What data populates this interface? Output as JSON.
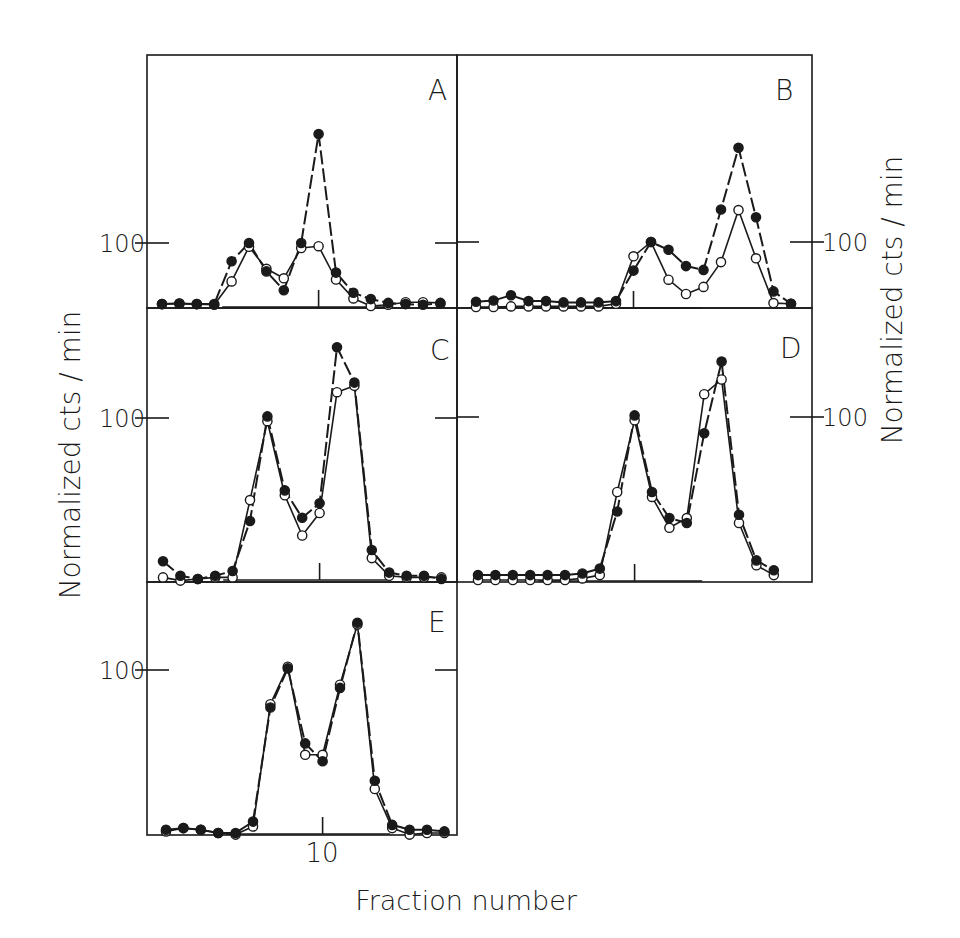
{
  "figure": {
    "xlabel": "Fraction number",
    "ylabel_left": "Normalized  cts / min",
    "ylabel_right": "Normalized  cts / min",
    "x_tick_label": "10",
    "y_tick_label": "100"
  },
  "chart_data": [
    {
      "panel": "A",
      "type": "line",
      "title": "A",
      "xlabel": "Fraction number",
      "ylabel": "Normalized cts/min",
      "x": [
        1,
        2,
        3,
        4,
        5,
        6,
        7,
        8,
        9,
        10,
        11,
        12,
        13,
        14,
        15,
        16,
        17
      ],
      "x_ticks": [
        10
      ],
      "y_ticks": [
        100
      ],
      "ylim": [
        0,
        390
      ],
      "series": [
        {
          "name": "filled circles",
          "marker": "filled",
          "values": [
            3,
            4,
            3,
            3,
            71,
            100,
            55,
            25,
            100,
            273,
            53,
            21,
            11,
            5,
            3,
            2,
            4
          ]
        },
        {
          "name": "open circles",
          "marker": "open",
          "values": [
            3,
            4,
            3,
            2,
            39,
            94,
            59,
            44,
            92,
            95,
            42,
            12,
            0,
            2,
            6,
            6,
            5
          ]
        }
      ]
    },
    {
      "panel": "B",
      "type": "line",
      "title": "B",
      "xlabel": "Fraction number",
      "ylabel": "Normalized cts/min",
      "x": [
        1,
        2,
        3,
        4,
        5,
        6,
        7,
        8,
        9,
        10,
        11,
        12,
        13,
        14,
        15,
        16,
        17,
        18,
        19
      ],
      "x_ticks": [
        10
      ],
      "y_ticks": [
        100
      ],
      "ylim": [
        0,
        390
      ],
      "series": [
        {
          "name": "filled circles",
          "marker": "filled",
          "values": [
            8,
            10,
            18,
            9,
            9,
            7,
            7,
            7,
            9,
            56,
            100,
            88,
            63,
            57,
            150,
            245,
            138,
            24,
            5
          ]
        },
        {
          "name": "open circles",
          "marker": "open",
          "values": [
            0,
            0,
            1,
            1,
            1,
            1,
            1,
            1,
            5,
            78,
            100,
            42,
            20,
            31,
            69,
            149,
            75,
            6,
            5
          ]
        }
      ]
    },
    {
      "panel": "C",
      "type": "line",
      "title": "C",
      "xlabel": "Fraction number",
      "ylabel": "Normalized cts/min",
      "x": [
        1,
        2,
        3,
        4,
        5,
        6,
        7,
        8,
        9,
        10,
        11,
        12,
        13,
        14,
        15,
        16,
        17
      ],
      "x_ticks": [
        10
      ],
      "y_ticks": [
        100
      ],
      "ylim": [
        0,
        170
      ],
      "series": [
        {
          "name": "filled circles",
          "marker": "filled",
          "values": [
            11,
            2,
            0,
            2,
            5,
            36,
            101,
            55,
            38,
            47,
            144,
            122,
            18,
            4,
            2,
            2,
            0
          ]
        },
        {
          "name": "open circles",
          "marker": "open",
          "values": [
            1,
            -1,
            0,
            1,
            1,
            49,
            98,
            52,
            27,
            41,
            116,
            120,
            13,
            2,
            1,
            1,
            1
          ]
        }
      ]
    },
    {
      "panel": "D",
      "type": "line",
      "title": "D",
      "xlabel": "Fraction number",
      "ylabel": "Normalized cts/min",
      "x": [
        1,
        2,
        3,
        4,
        5,
        6,
        7,
        8,
        9,
        10,
        11,
        12,
        13,
        14,
        15,
        16,
        17,
        18
      ],
      "x_ticks": [
        10
      ],
      "y_ticks": [
        100
      ],
      "ylim": [
        0,
        170
      ],
      "series": [
        {
          "name": "filled circles",
          "marker": "filled",
          "values": [
            3,
            3,
            3,
            3,
            3,
            3,
            4,
            7,
            42,
            101,
            54,
            38,
            35,
            90,
            134,
            40,
            12,
            6
          ]
        },
        {
          "name": "open circles",
          "marker": "open",
          "values": [
            0,
            0,
            0,
            0,
            0,
            0,
            1,
            3,
            54,
            98,
            51,
            32,
            38,
            114,
            123,
            35,
            9,
            3
          ]
        }
      ]
    },
    {
      "panel": "E",
      "type": "line",
      "title": "E",
      "xlabel": "Fraction number",
      "ylabel": "Normalized cts/min",
      "x": [
        1,
        2,
        3,
        4,
        5,
        6,
        7,
        8,
        9,
        10,
        11,
        12,
        13,
        14,
        15,
        16,
        17
      ],
      "x_ticks": [
        10
      ],
      "y_ticks": [
        100
      ],
      "ylim": [
        0,
        155
      ],
      "series": [
        {
          "name": "filled circles",
          "marker": "filled",
          "values": [
            2,
            3,
            2,
            0,
            0,
            7,
            77,
            101,
            55,
            44,
            89,
            129,
            32,
            5,
            2,
            2,
            1
          ]
        },
        {
          "name": "open circles",
          "marker": "open",
          "values": [
            1,
            3,
            2,
            0,
            -1,
            4,
            79,
            102,
            48,
            48,
            91,
            128,
            27,
            3,
            -1,
            0,
            0
          ]
        }
      ]
    }
  ],
  "layout": {
    "ink": "#1a1a1a",
    "panels": [
      {
        "id": "A",
        "x0": 147,
        "x1": 457,
        "y0": 55,
        "y1": 308,
        "base": 306,
        "y100": 243,
        "fx1": 162,
        "dx": 17.4,
        "tickSide": "left",
        "ytickLabelX": 122,
        "labelX": 428,
        "labelY": 100
      },
      {
        "id": "B",
        "x0": 457,
        "x1": 812,
        "y0": 55,
        "y1": 308,
        "base": 307,
        "y100": 242,
        "fx1": 476,
        "dx": 17.5,
        "tickSide": "right",
        "ytickLabelX": 845,
        "labelX": 775,
        "labelY": 100
      },
      {
        "id": "C",
        "x0": 147,
        "x1": 457,
        "y0": 308,
        "y1": 582,
        "base": 579,
        "y100": 418,
        "fx1": 163,
        "dx": 17.4,
        "tickSide": "left",
        "ytickLabelX": 122,
        "labelX": 430,
        "labelY": 360
      },
      {
        "id": "D",
        "x0": 457,
        "x1": 812,
        "y0": 308,
        "y1": 582,
        "base": 580,
        "y100": 417,
        "fx1": 478,
        "dx": 17.4,
        "tickSide": "right",
        "ytickLabelX": 845,
        "labelX": 780,
        "labelY": 358
      },
      {
        "id": "E",
        "x0": 147,
        "x1": 457,
        "y0": 582,
        "y1": 835,
        "base": 833,
        "y100": 670,
        "fx1": 166,
        "dx": 17.4,
        "tickSide": "left",
        "ytickLabelX": 122,
        "labelX": 428,
        "labelY": 632
      }
    ]
  }
}
